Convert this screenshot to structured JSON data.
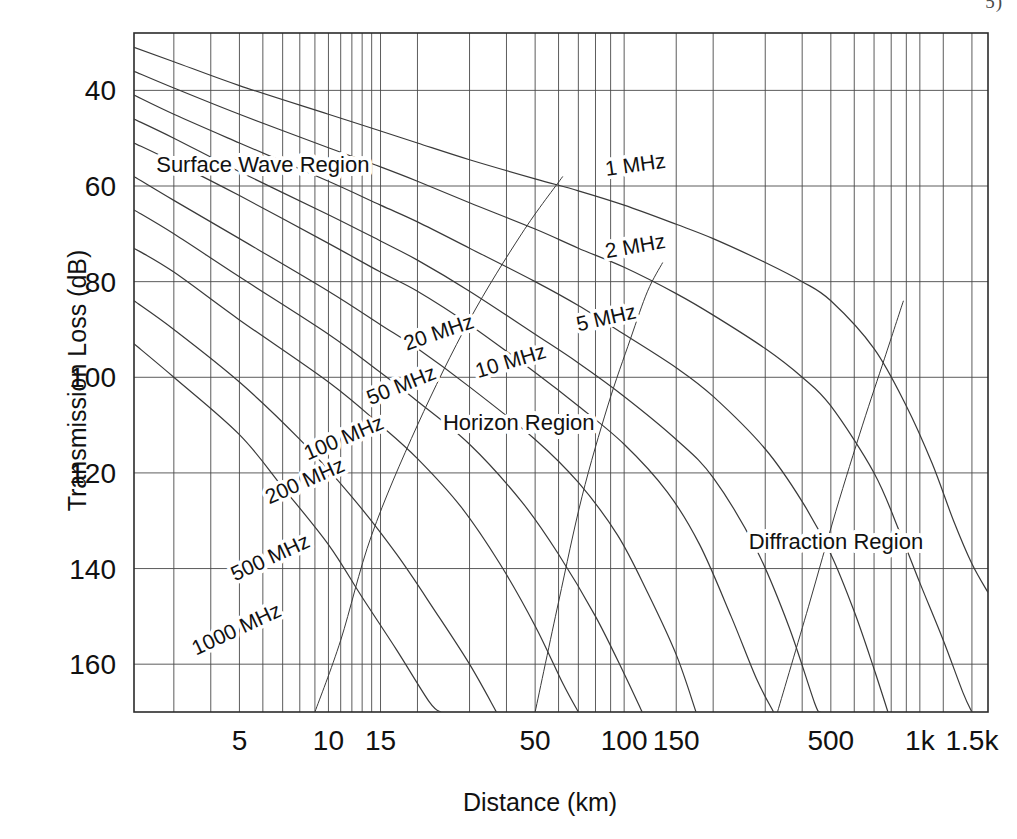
{
  "page": {
    "corner_mark": "5)"
  },
  "chart_data": {
    "type": "line",
    "title": "",
    "xlabel": "Distance (km)",
    "ylabel": "Transmission Loss (dB)",
    "xscale": "log",
    "xlim": [
      2.2,
      1700
    ],
    "ylim": [
      170,
      28
    ],
    "ylim_note": "y axis inverted: loss increases downward",
    "grid": true,
    "legend": "inline curve labels",
    "ytick_labels": [
      "40",
      "60",
      "80",
      "100",
      "120",
      "140",
      "160"
    ],
    "ytick_values": [
      40,
      60,
      80,
      100,
      120,
      140,
      160
    ],
    "xtick_labels": [
      "5",
      "10",
      "15",
      "50",
      "100",
      "150",
      "500",
      "1k",
      "1.5k"
    ],
    "xtick_values": [
      5,
      10,
      15,
      50,
      100,
      150,
      500,
      1000,
      1500
    ],
    "xgrid_minor_values": [
      3,
      4,
      6,
      7,
      8,
      9,
      11,
      12,
      13,
      14,
      20,
      30,
      40,
      60,
      70,
      80,
      90,
      200,
      300,
      400,
      600,
      700,
      800,
      900,
      1200
    ],
    "annotations": [
      {
        "text": "Surface Wave Region",
        "x_km": 6.0,
        "y_db": 57,
        "rotation": 0
      },
      {
        "text": "Horizon Region",
        "x_km": 44,
        "y_db": 111,
        "rotation": 0
      },
      {
        "text": "Diffraction Region",
        "x_km": 520,
        "y_db": 136,
        "rotation": 0
      }
    ],
    "series": [
      {
        "name": "1 MHz",
        "label_x_km": 110,
        "label_y_db": 57,
        "label_rotation": -8,
        "points": [
          [
            2.2,
            31
          ],
          [
            3,
            34
          ],
          [
            5,
            39
          ],
          [
            10,
            45
          ],
          [
            15,
            48.5
          ],
          [
            20,
            51
          ],
          [
            30,
            54.5
          ],
          [
            50,
            58.5
          ],
          [
            70,
            61
          ],
          [
            100,
            64
          ],
          [
            150,
            68
          ],
          [
            200,
            71
          ],
          [
            300,
            76
          ],
          [
            400,
            80
          ],
          [
            500,
            84
          ],
          [
            700,
            94
          ],
          [
            900,
            106
          ],
          [
            1100,
            118
          ],
          [
            1300,
            130
          ],
          [
            1500,
            139
          ],
          [
            1700,
            145
          ]
        ]
      },
      {
        "name": "2 MHz",
        "label_x_km": 110,
        "label_y_db": 74,
        "label_rotation": -10,
        "points": [
          [
            2.2,
            36
          ],
          [
            3,
            39.5
          ],
          [
            5,
            45
          ],
          [
            10,
            52
          ],
          [
            15,
            56
          ],
          [
            20,
            59
          ],
          [
            30,
            63.5
          ],
          [
            50,
            69
          ],
          [
            70,
            73
          ],
          [
            100,
            77
          ],
          [
            150,
            82.5
          ],
          [
            200,
            87
          ],
          [
            300,
            94
          ],
          [
            400,
            100
          ],
          [
            500,
            106
          ],
          [
            700,
            120
          ],
          [
            850,
            132
          ],
          [
            1000,
            143
          ],
          [
            1200,
            155
          ],
          [
            1400,
            166
          ],
          [
            1500,
            170
          ]
        ]
      },
      {
        "name": "5 MHz",
        "label_x_km": 88,
        "label_y_db": 89,
        "label_rotation": -13,
        "points": [
          [
            2.2,
            41
          ],
          [
            3,
            45
          ],
          [
            5,
            51
          ],
          [
            10,
            59
          ],
          [
            15,
            64
          ],
          [
            20,
            67.5
          ],
          [
            30,
            73
          ],
          [
            50,
            80
          ],
          [
            70,
            85
          ],
          [
            100,
            91
          ],
          [
            150,
            98
          ],
          [
            200,
            104
          ],
          [
            300,
            115
          ],
          [
            400,
            126
          ],
          [
            500,
            137
          ],
          [
            600,
            149
          ],
          [
            700,
            161
          ],
          [
            780,
            170
          ]
        ]
      },
      {
        "name": "10 MHz",
        "label_x_km": 42,
        "label_y_db": 98,
        "label_rotation": -17,
        "points": [
          [
            2.2,
            46
          ],
          [
            3,
            50
          ],
          [
            5,
            57
          ],
          [
            10,
            66
          ],
          [
            15,
            71.5
          ],
          [
            20,
            75.5
          ],
          [
            30,
            82
          ],
          [
            50,
            91
          ],
          [
            70,
            97
          ],
          [
            100,
            104
          ],
          [
            150,
            113
          ],
          [
            200,
            121
          ],
          [
            280,
            136
          ],
          [
            360,
            152
          ],
          [
            440,
            168
          ],
          [
            460,
            170
          ]
        ]
      },
      {
        "name": "20 MHz",
        "label_x_km": 24,
        "label_y_db": 92,
        "label_rotation": -19,
        "points": [
          [
            2.2,
            51
          ],
          [
            3,
            55
          ],
          [
            5,
            62
          ],
          [
            10,
            72
          ],
          [
            15,
            78
          ],
          [
            20,
            82
          ],
          [
            30,
            89
          ],
          [
            50,
            99
          ],
          [
            70,
            106
          ],
          [
            100,
            114
          ],
          [
            140,
            124
          ],
          [
            180,
            135
          ],
          [
            230,
            150
          ],
          [
            280,
            163
          ],
          [
            320,
            170
          ]
        ]
      },
      {
        "name": "50 MHz",
        "label_x_km": 18,
        "label_y_db": 103,
        "label_rotation": -22,
        "points": [
          [
            2.2,
            58
          ],
          [
            3,
            63
          ],
          [
            5,
            71
          ],
          [
            10,
            82
          ],
          [
            15,
            89
          ],
          [
            20,
            94
          ],
          [
            30,
            102
          ],
          [
            50,
            113
          ],
          [
            70,
            122
          ],
          [
            95,
            133
          ],
          [
            120,
            145
          ],
          [
            150,
            158
          ],
          [
            175,
            170
          ]
        ]
      },
      {
        "name": "100 MHz",
        "label_x_km": 11.5,
        "label_y_db": 114,
        "label_rotation": -23,
        "points": [
          [
            2.2,
            65
          ],
          [
            3,
            70
          ],
          [
            5,
            79
          ],
          [
            10,
            91
          ],
          [
            15,
            99
          ],
          [
            20,
            105
          ],
          [
            30,
            114
          ],
          [
            45,
            126
          ],
          [
            60,
            137
          ],
          [
            80,
            150
          ],
          [
            100,
            162
          ],
          [
            115,
            170
          ]
        ]
      },
      {
        "name": "200 MHz",
        "label_x_km": 8.5,
        "label_y_db": 123,
        "label_rotation": -24,
        "points": [
          [
            2.2,
            73
          ],
          [
            3,
            78
          ],
          [
            5,
            88
          ],
          [
            10,
            101
          ],
          [
            15,
            110
          ],
          [
            20,
            117
          ],
          [
            28,
            127
          ],
          [
            38,
            139
          ],
          [
            50,
            152
          ],
          [
            62,
            164
          ],
          [
            70,
            170
          ]
        ]
      },
      {
        "name": "500 MHz",
        "label_x_km": 6.5,
        "label_y_db": 139,
        "label_rotation": -25,
        "points": [
          [
            2.2,
            84
          ],
          [
            3,
            90
          ],
          [
            5,
            101
          ],
          [
            8,
            113
          ],
          [
            12,
            125
          ],
          [
            17,
            137
          ],
          [
            23,
            149
          ],
          [
            30,
            160
          ],
          [
            37,
            170
          ]
        ]
      },
      {
        "name": "1000 MHz",
        "label_x_km": 5.0,
        "label_y_db": 154,
        "label_rotation": -25,
        "points": [
          [
            2.2,
            93
          ],
          [
            3,
            100
          ],
          [
            5,
            112
          ],
          [
            7,
            123
          ],
          [
            10,
            135
          ],
          [
            13,
            146
          ],
          [
            17,
            157
          ],
          [
            22,
            168
          ],
          [
            24,
            170
          ]
        ]
      },
      {
        "name": "horizon-boundary",
        "is_boundary": true,
        "points": [
          [
            9.0,
            170
          ],
          [
            11,
            155
          ],
          [
            14,
            133
          ],
          [
            20,
            110
          ],
          [
            30,
            88
          ],
          [
            45,
            70
          ],
          [
            62,
            58
          ]
        ]
      },
      {
        "name": "diffraction-boundary",
        "is_boundary": true,
        "points": [
          [
            50,
            170
          ],
          [
            60,
            147
          ],
          [
            72,
            125
          ],
          [
            88,
            106
          ],
          [
            105,
            92
          ],
          [
            120,
            82
          ],
          [
            135,
            76
          ]
        ]
      },
      {
        "name": "diffraction-right-boundary",
        "is_boundary": true,
        "points": [
          [
            330,
            170
          ],
          [
            420,
            148
          ],
          [
            520,
            128
          ],
          [
            640,
            110
          ],
          [
            760,
            96
          ],
          [
            880,
            84
          ]
        ]
      }
    ]
  }
}
